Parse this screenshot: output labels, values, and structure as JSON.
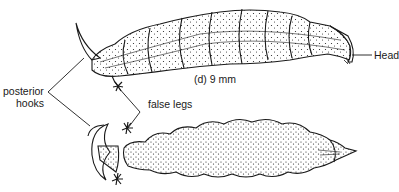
{
  "figure": {
    "caption": "(d) 9 mm",
    "labels": {
      "head": "Head",
      "posterior_hooks_line1": "posterior",
      "posterior_hooks_line2": "hooks",
      "false_legs": "false legs"
    },
    "views": [
      "lateral view of larva",
      "ventral view of larva"
    ],
    "colors": {
      "ink": "#1a1a1a",
      "background": "#ffffff"
    }
  }
}
